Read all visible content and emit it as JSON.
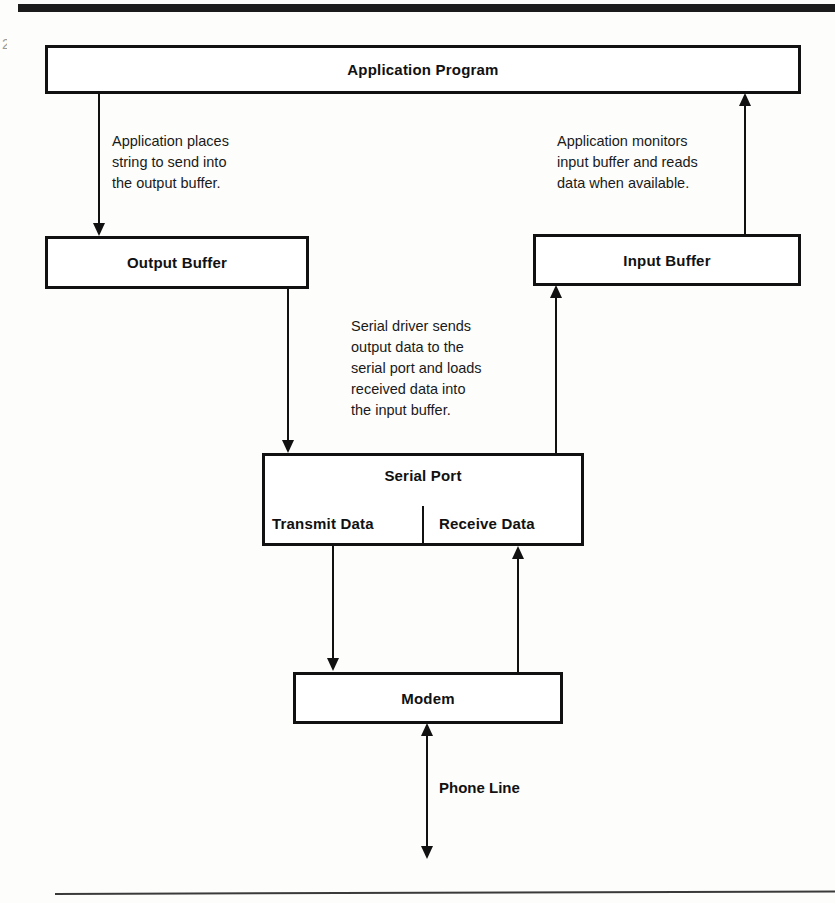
{
  "page": {
    "margin_mark": "2",
    "top_rule": "horizontal-rule",
    "bottom_rule": "horizontal-rule"
  },
  "diagram": {
    "boxes": {
      "application_program": "Application Program",
      "output_buffer": "Output Buffer",
      "input_buffer": "Input Buffer",
      "serial_port": "Serial Port",
      "transmit_data": "Transmit Data",
      "receive_data": "Receive Data",
      "modem": "Modem"
    },
    "notes": {
      "output_path": "Application places\nstring to send into\nthe output buffer.",
      "input_path": "Application monitors\ninput buffer and reads\ndata when available.",
      "serial_driver": "Serial driver sends\noutput data to the\nserial port and loads\nreceived data into\nthe input buffer."
    },
    "labels": {
      "phone_line": "Phone Line"
    },
    "connectors": [
      {
        "name": "application-to-output-buffer",
        "direction": "down"
      },
      {
        "name": "input-buffer-to-application",
        "direction": "up"
      },
      {
        "name": "output-buffer-to-serial-port",
        "direction": "down"
      },
      {
        "name": "serial-port-to-input-buffer",
        "direction": "up"
      },
      {
        "name": "transmit-data-to-modem",
        "direction": "down"
      },
      {
        "name": "modem-to-receive-data",
        "direction": "up"
      },
      {
        "name": "modem-to-phone-line",
        "direction": "both"
      }
    ],
    "colors": {
      "ink": "#111111",
      "paper": "#fdfdfc"
    }
  }
}
